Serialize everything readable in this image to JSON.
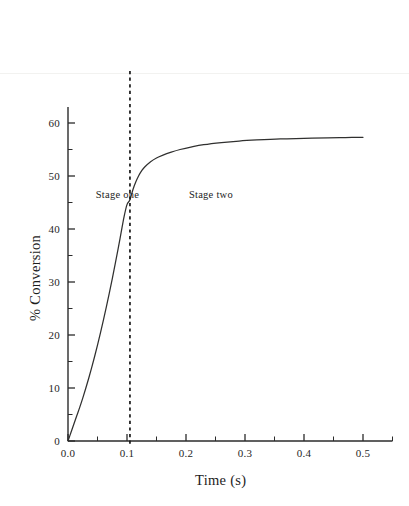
{
  "chart_data": {
    "type": "line",
    "title": "",
    "xlabel": "Time (s)",
    "ylabel": "% Conversion",
    "xlim": [
      0.0,
      0.55
    ],
    "ylim": [
      0,
      63
    ],
    "grid": false,
    "legend": "none",
    "xticks_major": [
      "0.0",
      "0.1",
      "0.2",
      "0.3",
      "0.4",
      "0.5"
    ],
    "xticks_major_values": [
      0.0,
      0.1,
      0.2,
      0.3,
      0.4,
      0.5
    ],
    "xticks_minor_values": [
      0.05,
      0.15,
      0.25,
      0.35,
      0.45,
      0.55
    ],
    "yticks_major": [
      "0",
      "10",
      "20",
      "30",
      "40",
      "50",
      "60"
    ],
    "yticks_major_values": [
      0,
      10,
      20,
      30,
      40,
      50,
      60
    ],
    "yticks_minor_values": [
      5,
      15,
      25,
      35,
      45,
      55
    ],
    "series": [
      {
        "name": "conversion",
        "x": [
          0.0,
          0.005,
          0.01,
          0.015,
          0.02,
          0.025,
          0.03,
          0.035,
          0.04,
          0.045,
          0.05,
          0.055,
          0.06,
          0.065,
          0.07,
          0.075,
          0.08,
          0.085,
          0.09,
          0.095,
          0.1,
          0.105,
          0.11,
          0.115,
          0.12,
          0.125,
          0.13,
          0.14,
          0.15,
          0.16,
          0.175,
          0.19,
          0.21,
          0.23,
          0.26,
          0.29,
          0.32,
          0.36,
          0.4,
          0.44,
          0.47,
          0.5
        ],
        "values": [
          0.0,
          1.6,
          3.2,
          4.8,
          6.4,
          8.1,
          9.9,
          11.8,
          13.8,
          15.9,
          18.1,
          20.4,
          22.8,
          25.3,
          27.9,
          30.6,
          33.4,
          36.3,
          39.3,
          42.3,
          44.6,
          45.5,
          47.4,
          48.9,
          50.1,
          51.0,
          51.7,
          52.7,
          53.4,
          53.9,
          54.5,
          55.0,
          55.5,
          55.9,
          56.3,
          56.6,
          56.8,
          57.0,
          57.1,
          57.2,
          57.25,
          57.3
        ]
      }
    ],
    "annotations": [
      {
        "id": "stage-one",
        "text": "Stage one",
        "x": 0.047,
        "y": 46.5
      },
      {
        "id": "stage-two",
        "text": "Stage two",
        "x": 0.205,
        "y": 46.5
      }
    ],
    "reference_lines": [
      {
        "id": "stage-divider",
        "orientation": "vertical",
        "x": 0.105,
        "style": "dashed",
        "color": "#181818"
      }
    ]
  },
  "axes": {
    "x_title": "Time (s)",
    "y_title": "% Conversion"
  },
  "colors": {
    "curve": "#30302f",
    "axis": "#2b2b2b",
    "divider": "#181818",
    "background": "#ffffff"
  }
}
